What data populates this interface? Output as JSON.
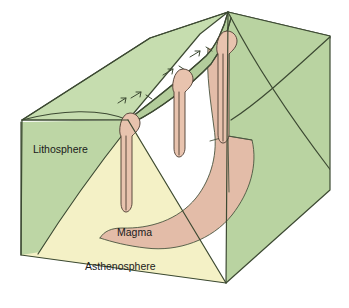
{
  "diagram": {
    "type": "geology-block-diagram",
    "labels": [
      {
        "id": "lithosphere",
        "text": "Lithosphere",
        "x": 33,
        "y": 153
      },
      {
        "id": "magma",
        "text": "Magma",
        "x": 117,
        "y": 236
      },
      {
        "id": "asthenosphere",
        "text": "Asthenosphere",
        "x": 85,
        "y": 270
      }
    ],
    "colors": {
      "lithosphere_top": "#c3dbab",
      "lithosphere_left_face": "#bdd6a5",
      "lithosphere_right_face": "#b9d3a1",
      "asthenosphere": "#f4f1c6",
      "magma": "#e3bca8",
      "magma_bulb": "#e8c3ae",
      "outline": "#3d4a33",
      "text": "#1a1a1a",
      "background": "#ffffff"
    },
    "features": {
      "ridge_axis_label": "spreading-ridge-axis",
      "conduit_count": 3,
      "arrow_count": 4,
      "arrow_direction": "along-ridge-axis-upward-right"
    },
    "geometry": {
      "top_peak": [
        228,
        12
      ],
      "right_corner": [
        330,
        36
      ],
      "left_top_back": [
        22,
        120
      ],
      "left_bottom_front": [
        21,
        255
      ],
      "bottom_vertex": [
        226,
        283
      ],
      "right_bottom": [
        330,
        190
      ],
      "conduits": [
        {
          "id": "conduit-left",
          "bulb": [
            130,
            122
          ],
          "depth": 207
        },
        {
          "id": "conduit-middle",
          "bulb": [
            183,
            78
          ],
          "depth": 152
        },
        {
          "id": "conduit-right",
          "bulb": [
            227,
            40
          ],
          "depth": 140
        }
      ]
    }
  }
}
